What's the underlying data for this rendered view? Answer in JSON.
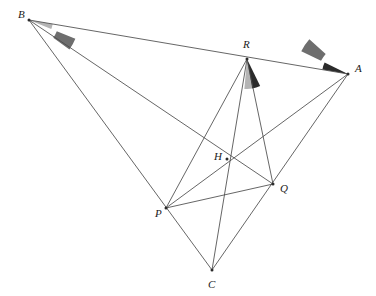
{
  "figure": {
    "canvas": {
      "width": 376,
      "height": 296,
      "background": "#ffffff"
    },
    "line_color": "#4a4a4a",
    "label_color": "#1a1a1a",
    "points": [
      {
        "id": "A",
        "label": "A",
        "x": 348,
        "y": 74,
        "label_x": 355,
        "label_y": 72
      },
      {
        "id": "B",
        "label": "B",
        "x": 29,
        "y": 20,
        "label_x": 18,
        "label_y": 18
      },
      {
        "id": "C",
        "label": "C",
        "x": 212,
        "y": 270,
        "label_x": 208,
        "label_y": 288
      },
      {
        "id": "P",
        "label": "P",
        "x": 166,
        "y": 208,
        "label_x": 155,
        "label_y": 217
      },
      {
        "id": "Q",
        "label": "Q",
        "x": 273,
        "y": 184,
        "label_x": 280,
        "label_y": 192
      },
      {
        "id": "R",
        "label": "R",
        "x": 247,
        "y": 59,
        "label_x": 243,
        "label_y": 48
      },
      {
        "id": "H",
        "label": "H",
        "x": 227,
        "y": 159,
        "label_x": 214,
        "label_y": 160
      }
    ],
    "segments": [
      {
        "name": "segment-B-A",
        "from": "B",
        "to": "A"
      },
      {
        "name": "segment-B-C",
        "from": "B",
        "to": "C"
      },
      {
        "name": "segment-B-Q",
        "from": "B",
        "to": "Q"
      },
      {
        "name": "segment-A-C",
        "from": "A",
        "to": "C"
      },
      {
        "name": "segment-A-P",
        "from": "A",
        "to": "P"
      },
      {
        "name": "segment-C-R",
        "from": "C",
        "to": "R"
      },
      {
        "name": "segment-R-P",
        "from": "R",
        "to": "P"
      },
      {
        "name": "segment-R-Q",
        "from": "R",
        "to": "Q"
      },
      {
        "name": "segment-P-Q",
        "from": "P",
        "to": "Q"
      }
    ],
    "marked_vertices": [
      "B",
      "A",
      "C",
      "P",
      "Q",
      "R",
      "H"
    ],
    "angle_marks": [
      {
        "name": "angle-mark-B-inner",
        "at": "B",
        "shade": "light",
        "color": "#b4b4b4",
        "start_deg": 9.6,
        "end_deg": 22.0,
        "inner_radius": 0,
        "outer_radius": 24
      },
      {
        "name": "angle-mark-B-outer",
        "at": "B",
        "shade": "medium",
        "color": "#6e6e6e",
        "start_deg": 22.0,
        "end_deg": 36.0,
        "inner_radius": 30,
        "outer_radius": 50
      },
      {
        "name": "angle-mark-R-left",
        "at": "R",
        "shade": "light",
        "color": "#b4b4b4",
        "start_deg": 80.0,
        "end_deg": 95.0,
        "inner_radius": 0,
        "outer_radius": 30
      },
      {
        "name": "angle-mark-R-right",
        "at": "R",
        "shade": "dark",
        "color": "#2b2b2b",
        "start_deg": 64.0,
        "end_deg": 80.0,
        "inner_radius": 0,
        "outer_radius": 30
      },
      {
        "name": "angle-mark-A-inner",
        "at": "A",
        "shade": "dark",
        "color": "#2b2b2b",
        "start_deg": 190.0,
        "end_deg": 206.0,
        "inner_radius": 0,
        "outer_radius": 26
      },
      {
        "name": "angle-mark-A-outer",
        "at": "A",
        "shade": "medium",
        "color": "#6e6e6e",
        "start_deg": 206.0,
        "end_deg": 222.0,
        "inner_radius": 30,
        "outer_radius": 52
      }
    ]
  }
}
